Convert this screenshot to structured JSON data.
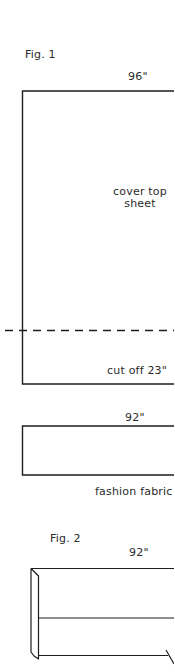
{
  "figure1": {
    "title": "Fig. 1",
    "top_sheet": {
      "width_label": "96\"",
      "body_label_line1": "cover top",
      "body_label_line2": "sheet",
      "cut_label": "cut off 23\""
    },
    "fashion_fabric": {
      "width_label": "92\"",
      "caption": "fashion fabric"
    }
  },
  "figure2": {
    "title": "Fig. 2",
    "width_label": "92\""
  },
  "colors": {
    "line": "#1e1e1e",
    "text": "#2b2b2b",
    "background": "#ffffff"
  }
}
